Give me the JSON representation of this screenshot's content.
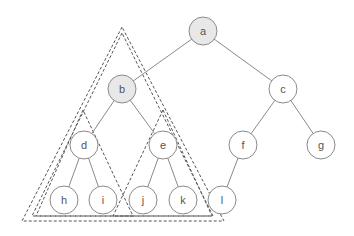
{
  "diagram": {
    "type": "binary-tree",
    "radius": 14,
    "colors": {
      "node_fill": "#ffffff",
      "highlight_fill": "#e8e8e8",
      "stroke": "#8a8a8a",
      "text": "#555555",
      "triangle_stroke": "#555555"
    },
    "nodes": [
      {
        "id": "a",
        "label": "a",
        "x": 203,
        "y": 31,
        "highlighted": true
      },
      {
        "id": "b",
        "label": "b",
        "x": 122,
        "y": 89,
        "highlighted": true
      },
      {
        "id": "c",
        "label": "c",
        "x": 283,
        "y": 89,
        "highlighted": false
      },
      {
        "id": "d",
        "label": "d",
        "x": 84,
        "y": 145,
        "highlighted": false
      },
      {
        "id": "e",
        "label": "e",
        "x": 163,
        "y": 145,
        "highlighted": false
      },
      {
        "id": "f",
        "label": "f",
        "x": 243,
        "y": 145,
        "highlighted": false
      },
      {
        "id": "g",
        "label": "g",
        "x": 321,
        "y": 145,
        "highlighted": false
      },
      {
        "id": "h",
        "label": "h",
        "x": 64,
        "y": 200,
        "highlighted": false
      },
      {
        "id": "i",
        "label": "i",
        "x": 103,
        "y": 200,
        "highlighted": false
      },
      {
        "id": "j",
        "label": "j",
        "x": 143,
        "y": 200,
        "highlighted": false
      },
      {
        "id": "k",
        "label": "k",
        "x": 183,
        "y": 200,
        "highlighted": false
      },
      {
        "id": "l",
        "label": "l",
        "x": 222,
        "y": 200,
        "highlighted": false
      }
    ],
    "edges": [
      [
        "a",
        "b"
      ],
      [
        "a",
        "c"
      ],
      [
        "b",
        "d"
      ],
      [
        "b",
        "e"
      ],
      [
        "c",
        "f"
      ],
      [
        "c",
        "g"
      ],
      [
        "d",
        "h"
      ],
      [
        "d",
        "i"
      ],
      [
        "e",
        "j"
      ],
      [
        "e",
        "k"
      ],
      [
        "f",
        "l"
      ]
    ],
    "triangles": [
      {
        "name": "subtree-b-outer",
        "points": [
          [
            122,
            27
          ],
          [
            22,
            221
          ],
          [
            224,
            221
          ]
        ]
      },
      {
        "name": "subtree-b-inner",
        "points": [
          [
            122,
            33
          ],
          [
            32,
            216
          ],
          [
            213,
            216
          ]
        ]
      },
      {
        "name": "subtree-d",
        "points": [
          [
            83,
            110
          ],
          [
            36,
            216
          ],
          [
            133,
            216
          ]
        ]
      },
      {
        "name": "subtree-e",
        "points": [
          [
            163,
            110
          ],
          [
            113,
            216
          ],
          [
            212,
            216
          ]
        ]
      }
    ]
  }
}
